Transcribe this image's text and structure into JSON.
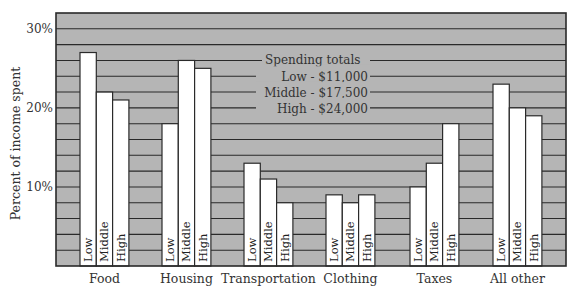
{
  "chart_data": {
    "type": "bar",
    "title": "",
    "xlabel": "",
    "ylabel": "Percent of income spent",
    "ylim": [
      0,
      32
    ],
    "yticks": [
      {
        "value": 10,
        "label": "10%"
      },
      {
        "value": 20,
        "label": "20%"
      },
      {
        "value": 30,
        "label": "30%"
      }
    ],
    "gridline_step": 2,
    "grid": true,
    "categories": [
      "Food",
      "Housing",
      "Transportation",
      "Clothing",
      "Taxes",
      "All other"
    ],
    "series": [
      {
        "name": "Low",
        "values": [
          27,
          18,
          13,
          9,
          10,
          23
        ]
      },
      {
        "name": "Middle",
        "values": [
          22,
          26,
          11,
          8,
          13,
          20
        ]
      },
      {
        "name": "High",
        "values": [
          21,
          25,
          8,
          9,
          18,
          19
        ]
      }
    ],
    "legend": {
      "title": "Spending totals",
      "placement": "top-center",
      "entries": [
        "Low - $11,000",
        "Middle - $17,500",
        "High - $24,000"
      ]
    },
    "colors": {
      "plot_background": "#b5b5b5",
      "bar_fill": "#ffffff",
      "line": "#2a2a2a"
    }
  }
}
